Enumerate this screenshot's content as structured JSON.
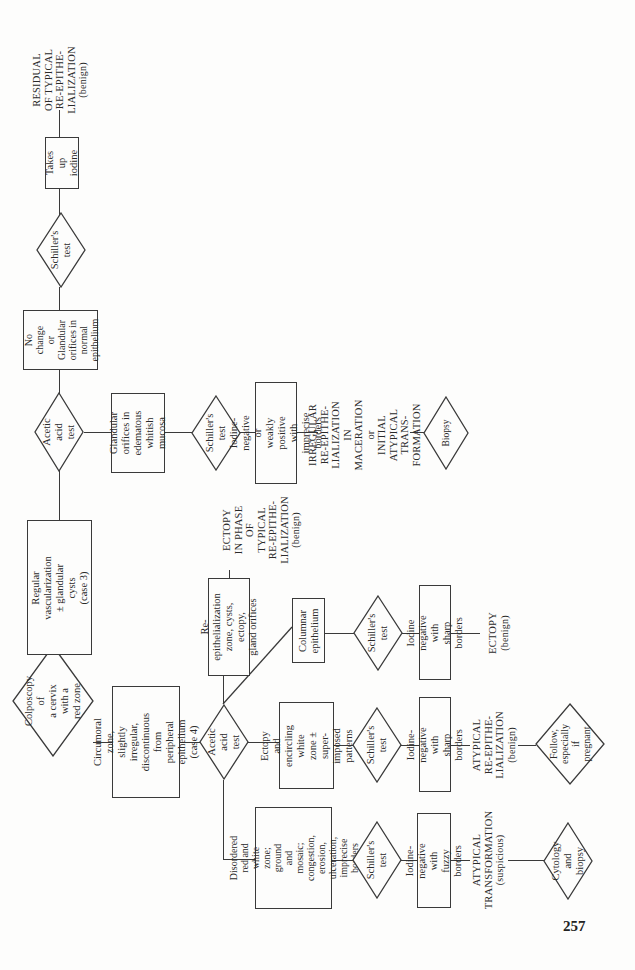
{
  "page_number": "257",
  "root": {
    "label": "Colposcopy of\na cervix with a\nred zone"
  },
  "branch_case3": {
    "finding": "Regular\nvascularization\n± glandular cysts\n(case 3)",
    "test": "Acetic acid\ntest",
    "upper": {
      "result": "No change\nor\nGlandular\norifices in\nnormal\nepithelium",
      "test": "Schiller's\ntest",
      "outcome": "Takes up\niodine",
      "diagnosis": "RESIDUAL\nOF TYPICAL\nRE-EPITHE-\nLIALIZATION",
      "qualifier": "(benign)"
    },
    "lower": {
      "result": "Glandular\norifices in\nedematous\nwhitish mucosa",
      "test": "Schiller's\ntest",
      "outcome": "Iodine-negative or\nweakly positive with\nimprecise borders",
      "diagnosis": "IRREGULAR\nRE-EPITHE-\nLIALIZATION IN\nMACERATION\nor\nINITIAL\nATYPICAL TRANS-\nFORMATION",
      "action": "Biopsy"
    }
  },
  "branch_case4": {
    "finding": "Circumoral zone,\nslightly irregular,\ndiscontinuous from\nperipheral epithelium\n(case 4)",
    "test": "Acetic acid\ntest",
    "reepith": {
      "result": "Re-epithelialization\nzone, cysts, ectopy,\ngland orifices",
      "diagnosis": "ECTOPY\nIN PHASE\nOF\nTYPICAL\nRE-EPITHE-\nLIALIZATION",
      "qualifier": "(benign)"
    },
    "columnar": {
      "result": "Columnar\nepithelium",
      "test": "Schiller's\ntest",
      "outcome": "Iodine negative\nwith sharp borders",
      "diagnosis": "ECTOPY",
      "qualifier": "(benign)"
    },
    "ectopy_white": {
      "result": "Ectopy and\nencircling white\nzone ± super-\nimposed patterns",
      "test": "Schiller's\ntest",
      "outcome": "Iodine-negative\nwith sharp borders",
      "diagnosis": "ATYPICAL\nRE-EPITHE-\nLIALIZATION",
      "qualifier": "(benign)",
      "action": "Follow,\nespecially if\npregnant"
    },
    "disordered": {
      "result": "Disordered red and\nwhite zone; ground\nand mosaic;\ncongestion, erosion,\nulceration, imprecise\nborders",
      "test": "Schiller's\ntest",
      "outcome": "Iodine-negative\nwith fuzzy borders",
      "diagnosis": "ATYPICAL\nTRANSFORMATION",
      "qualifier": "(suspicious)",
      "action": "Cytology\nand biopsy"
    }
  }
}
